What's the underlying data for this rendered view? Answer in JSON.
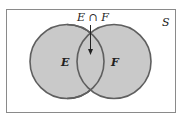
{
  "diagram": {
    "type": "venn",
    "universe_label": "S",
    "sets": [
      {
        "label": "E"
      },
      {
        "label": "F"
      }
    ],
    "intersection_label": "E ∩ F",
    "colors": {
      "fill": "#c9c9c9",
      "stroke": "#5f5f5f",
      "frame": "#8a8a8a"
    }
  }
}
